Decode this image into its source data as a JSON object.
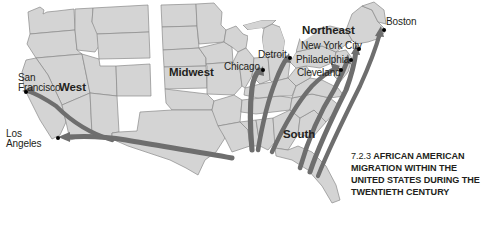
{
  "figure": {
    "caption_number": "7.2.3",
    "caption_text": "AFRICAN AMERICAN MIGRATION WITHIN THE UNITED STATES DURING THE TWENTIETH CENTURY"
  },
  "colors": {
    "land_fill": "#d4d4d4",
    "land_stroke": "#8a8a8a",
    "water_fill": "#ffffff",
    "arrow_fill": "#6e6e6e",
    "text": "#231f20",
    "dot": "#000000",
    "background": "#ffffff"
  },
  "regions": [
    {
      "name": "west-region",
      "label": "West",
      "x": 59,
      "y": 81
    },
    {
      "name": "midwest-region",
      "label": "Midwest",
      "x": 169,
      "y": 66
    },
    {
      "name": "northeast-region",
      "label": "Northeast",
      "x": 302,
      "y": 24
    },
    {
      "name": "south-region",
      "label": "South",
      "x": 283,
      "y": 128
    }
  ],
  "cities": [
    {
      "name": "san-francisco",
      "label": "San\nFrancisco",
      "label_x": 18,
      "label_y": 73,
      "dot_x": 24,
      "dot_y": 90,
      "lines": [
        "San",
        "Francisco"
      ]
    },
    {
      "name": "los-angeles",
      "label": "Los\nAngeles",
      "label_x": 6,
      "label_y": 129,
      "dot_x": 56,
      "dot_y": 136,
      "lines": [
        "Los",
        "Angeles"
      ]
    },
    {
      "name": "chicago",
      "label": "Chicago",
      "label_x": 224,
      "label_y": 62,
      "dot_x": 261,
      "dot_y": 68,
      "lines": [
        "Chicago"
      ]
    },
    {
      "name": "detroit",
      "label": "Detroit",
      "label_x": 258,
      "label_y": 50,
      "dot_x": 288,
      "dot_y": 56,
      "lines": [
        "Detroit"
      ]
    },
    {
      "name": "cleveland",
      "label": "Cleveland",
      "label_x": 297,
      "label_y": 68,
      "dot_x": 339,
      "dot_y": 68,
      "lines": [
        "Cleveland"
      ]
    },
    {
      "name": "philadelphia",
      "label": "Philadelphia",
      "label_x": 296,
      "label_y": 55,
      "dot_x": 349,
      "dot_y": 58,
      "lines": [
        "Philadelphia"
      ]
    },
    {
      "name": "new-york-city",
      "label": "New York City",
      "label_x": 301,
      "label_y": 41,
      "dot_x": 357,
      "dot_y": 47,
      "lines": [
        "New York City"
      ]
    },
    {
      "name": "boston",
      "label": "Boston",
      "label_x": 386,
      "label_y": 17,
      "dot_x": 382,
      "dot_y": 28,
      "lines": [
        "Boston"
      ]
    }
  ],
  "migration_flows": [
    {
      "name": "south-to-chicago",
      "from": "South",
      "to": "Chicago"
    },
    {
      "name": "south-to-detroit",
      "from": "South",
      "to": "Detroit"
    },
    {
      "name": "south-to-cleveland",
      "from": "South",
      "to": "Cleveland"
    },
    {
      "name": "south-to-philadelphia",
      "from": "South",
      "to": "Philadelphia"
    },
    {
      "name": "south-to-new-york-city",
      "from": "South",
      "to": "New York City"
    },
    {
      "name": "south-to-boston",
      "from": "South",
      "to": "Boston"
    },
    {
      "name": "south-to-los-angeles",
      "from": "South",
      "to": "Los Angeles"
    },
    {
      "name": "south-to-san-francisco",
      "from": "South",
      "to": "San Francisco"
    }
  ]
}
